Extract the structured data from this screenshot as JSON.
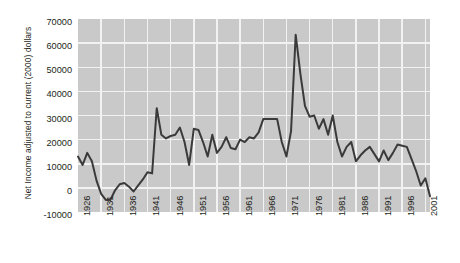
{
  "chart_data": {
    "type": "line",
    "title": "",
    "xlabel": "",
    "ylabel": "Net Income adjusted to current (2000) dollars",
    "xlim": [
      1926,
      2002
    ],
    "ylim": [
      -10000,
      70000
    ],
    "grid": true,
    "legend": "none",
    "ytick_labels": [
      "70000",
      "60000",
      "50000",
      "40000",
      "30000",
      "20000",
      "10000",
      "0",
      "-10000"
    ],
    "ytick_values": [
      70000,
      60000,
      50000,
      40000,
      30000,
      20000,
      10000,
      0,
      -10000
    ],
    "xtick_labels": [
      "1926",
      "1931",
      "1936",
      "1941",
      "1946",
      "1951",
      "1956",
      "1961",
      "1966",
      "1971",
      "1976",
      "1981",
      "1986",
      "1991",
      "1996",
      "2001"
    ],
    "xtick_values": [
      1926,
      1931,
      1936,
      1941,
      1946,
      1951,
      1956,
      1961,
      1966,
      1971,
      1976,
      1981,
      1986,
      1991,
      1996,
      2001
    ],
    "series": [
      {
        "name": "Net income",
        "color": "#3a3a3a",
        "x": [
          1926,
          1927,
          1928,
          1929,
          1930,
          1931,
          1932,
          1933,
          1934,
          1935,
          1936,
          1937,
          1938,
          1939,
          1940,
          1941,
          1942,
          1943,
          1944,
          1945,
          1946,
          1947,
          1948,
          1949,
          1950,
          1951,
          1952,
          1953,
          1954,
          1955,
          1956,
          1957,
          1958,
          1959,
          1960,
          1961,
          1962,
          1963,
          1964,
          1965,
          1966,
          1967,
          1968,
          1969,
          1970,
          1971,
          1972,
          1973,
          1974,
          1975,
          1976,
          1977,
          1978,
          1979,
          1980,
          1981,
          1982,
          1983,
          1984,
          1985,
          1986,
          1987,
          1988,
          1989,
          1990,
          1991,
          1992,
          1993,
          1994,
          1995,
          1996,
          1997,
          1998,
          1999,
          2000,
          2001,
          2002
        ],
        "values": [
          13000,
          9500,
          14500,
          11000,
          3000,
          -2500,
          -5000,
          -5000,
          -1000,
          1500,
          2000,
          500,
          -1500,
          1000,
          3500,
          6500,
          6000,
          33000,
          22000,
          20500,
          21500,
          22000,
          25000,
          19000,
          9500,
          24500,
          24000,
          19000,
          13000,
          22000,
          14500,
          17000,
          21000,
          16500,
          16000,
          20000,
          19000,
          21000,
          20500,
          23000,
          28500,
          28500,
          28500,
          28500,
          19000,
          13000,
          23500,
          63500,
          47500,
          34000,
          29500,
          30000,
          24500,
          28500,
          22000,
          30000,
          19000,
          13000,
          17000,
          19000,
          11000,
          13500,
          15500,
          17000,
          14000,
          11000,
          15500,
          11500,
          14500,
          18000,
          17500,
          17000,
          12000,
          7000,
          1000,
          4000,
          -3500
        ]
      }
    ]
  }
}
